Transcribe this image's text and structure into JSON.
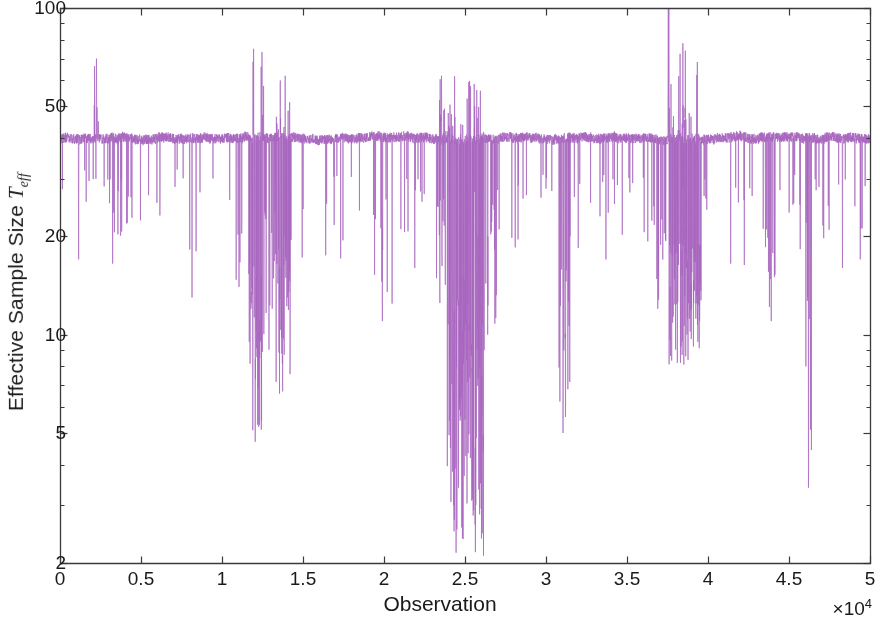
{
  "chart_data": {
    "type": "line",
    "title": "",
    "xlabel": "Observation",
    "ylabel": "Effective Sample Size T_eff",
    "ylabel_text": "Effective Sample Size ",
    "ylabel_symbol": "T",
    "ylabel_subscript": "eff",
    "xmultiplier_prefix": "×10",
    "xmultiplier_exponent": "4",
    "yscale": "log",
    "xscale": "linear",
    "grid": false,
    "legend": null,
    "xlim": [
      0,
      50000
    ],
    "ylim": [
      2,
      100
    ],
    "xticks": [
      0,
      5000,
      10000,
      15000,
      20000,
      25000,
      30000,
      35000,
      40000,
      45000,
      50000
    ],
    "xtick_labels": [
      "0",
      "0.5",
      "1",
      "1.5",
      "2",
      "2.5",
      "3",
      "3.5",
      "4",
      "4.5",
      "5"
    ],
    "yticks": [
      2,
      5,
      10,
      20,
      50,
      100
    ],
    "ytick_labels": [
      "2",
      "5",
      "10",
      "20",
      "50",
      "100"
    ],
    "series": [
      {
        "name": "Effective Sample Size",
        "color": "#a866bf",
        "linewidth": 0.7,
        "baseline": 40,
        "baseline_noise": 0.07,
        "description": "Per-observation effective sample size T_eff for a particle filter; hovers near 40 with frequent sharp downward spikes and several dense low-ESS episodes.",
        "n_points": 50000,
        "regions": [
          {
            "x_start": 0,
            "x_end": 1400,
            "kind": "calm",
            "dip_rate": 0.012,
            "dip_min": 17,
            "dip_typ": 30
          },
          {
            "x_start": 1400,
            "x_end": 2100,
            "kind": "calm",
            "dip_rate": 0.02,
            "dip_min": 22,
            "dip_typ": 32
          },
          {
            "x_start": 2100,
            "x_end": 2400,
            "kind": "peak",
            "peak_max": 70,
            "dip_rate": 0.02,
            "dip_min": 24,
            "dip_typ": 32
          },
          {
            "x_start": 2400,
            "x_end": 4500,
            "kind": "moderate",
            "dip_rate": 0.035,
            "dip_min": 16,
            "dip_typ": 30
          },
          {
            "x_start": 4500,
            "x_end": 8000,
            "kind": "calm",
            "dip_rate": 0.02,
            "dip_min": 22,
            "dip_typ": 33
          },
          {
            "x_start": 8000,
            "x_end": 8600,
            "kind": "moderate",
            "dip_rate": 0.05,
            "dip_min": 13,
            "dip_typ": 28
          },
          {
            "x_start": 8600,
            "x_end": 10800,
            "kind": "calm",
            "dip_rate": 0.018,
            "dip_min": 25,
            "dip_typ": 34
          },
          {
            "x_start": 10800,
            "x_end": 11600,
            "kind": "moderate",
            "dip_rate": 0.06,
            "dip_min": 14,
            "dip_typ": 27
          },
          {
            "x_start": 11600,
            "x_end": 12600,
            "kind": "turbulent",
            "peak_max": 75,
            "dip_rate": 0.45,
            "dip_min": 4.6,
            "dip_typ": 17
          },
          {
            "x_start": 12600,
            "x_end": 13300,
            "kind": "moderate",
            "dip_rate": 0.18,
            "dip_min": 9,
            "dip_typ": 24
          },
          {
            "x_start": 13300,
            "x_end": 14300,
            "kind": "turbulent",
            "peak_max": 62,
            "dip_rate": 0.4,
            "dip_min": 6.5,
            "dip_typ": 20
          },
          {
            "x_start": 14300,
            "x_end": 19300,
            "kind": "calm",
            "dip_rate": 0.025,
            "dip_min": 17,
            "dip_typ": 31
          },
          {
            "x_start": 19300,
            "x_end": 20600,
            "kind": "moderate",
            "dip_rate": 0.08,
            "dip_min": 11,
            "dip_typ": 26
          },
          {
            "x_start": 20600,
            "x_end": 23200,
            "kind": "calm",
            "dip_rate": 0.03,
            "dip_min": 16,
            "dip_typ": 30
          },
          {
            "x_start": 23200,
            "x_end": 23900,
            "kind": "peak",
            "peak_max": 62,
            "dip_rate": 0.12,
            "dip_min": 12,
            "dip_typ": 26
          },
          {
            "x_start": 23900,
            "x_end": 26200,
            "kind": "turbulent",
            "peak_max": 68,
            "dip_rate": 0.55,
            "dip_min": 2.1,
            "dip_typ": 13
          },
          {
            "x_start": 26200,
            "x_end": 27000,
            "kind": "moderate",
            "dip_rate": 0.12,
            "dip_min": 10,
            "dip_typ": 25
          },
          {
            "x_start": 27000,
            "x_end": 30800,
            "kind": "calm",
            "dip_rate": 0.025,
            "dip_min": 18,
            "dip_typ": 31
          },
          {
            "x_start": 30800,
            "x_end": 31500,
            "kind": "moderate",
            "dip_rate": 0.3,
            "dip_min": 5.0,
            "dip_typ": 20
          },
          {
            "x_start": 31500,
            "x_end": 36600,
            "kind": "calm",
            "dip_rate": 0.028,
            "dip_min": 17,
            "dip_typ": 31
          },
          {
            "x_start": 36600,
            "x_end": 37500,
            "kind": "moderate",
            "dip_rate": 0.1,
            "dip_min": 12,
            "dip_typ": 26
          },
          {
            "x_start": 37500,
            "x_end": 37600,
            "kind": "spike",
            "peak_max": 140,
            "dip_rate": 0.05,
            "dip_min": 20,
            "dip_typ": 32
          },
          {
            "x_start": 37600,
            "x_end": 39600,
            "kind": "turbulent",
            "peak_max": 78,
            "dip_rate": 0.5,
            "dip_min": 8,
            "dip_typ": 19
          },
          {
            "x_start": 39600,
            "x_end": 43500,
            "kind": "calm",
            "dip_rate": 0.03,
            "dip_min": 15,
            "dip_typ": 30
          },
          {
            "x_start": 43500,
            "x_end": 44300,
            "kind": "moderate",
            "dip_rate": 0.09,
            "dip_min": 11,
            "dip_typ": 26
          },
          {
            "x_start": 44300,
            "x_end": 46000,
            "kind": "calm",
            "dip_rate": 0.03,
            "dip_min": 18,
            "dip_typ": 31
          },
          {
            "x_start": 46000,
            "x_end": 46400,
            "kind": "moderate",
            "dip_rate": 0.2,
            "dip_min": 3.4,
            "dip_typ": 22
          },
          {
            "x_start": 46400,
            "x_end": 50000,
            "kind": "calm",
            "dip_rate": 0.03,
            "dip_min": 16,
            "dip_typ": 30
          }
        ],
        "deep_spikes": [
          {
            "x": 1150,
            "y": 17.0
          },
          {
            "x": 3250,
            "y": 16.5
          },
          {
            "x": 4150,
            "y": 22.0
          },
          {
            "x": 8150,
            "y": 13.0
          },
          {
            "x": 8400,
            "y": 18.0
          },
          {
            "x": 11050,
            "y": 14.0
          },
          {
            "x": 11900,
            "y": 5.1
          },
          {
            "x": 12050,
            "y": 4.7
          },
          {
            "x": 12200,
            "y": 5.3
          },
          {
            "x": 12400,
            "y": 9.5
          },
          {
            "x": 12900,
            "y": 9.0
          },
          {
            "x": 13100,
            "y": 12.0
          },
          {
            "x": 13550,
            "y": 6.6
          },
          {
            "x": 13750,
            "y": 8.0
          },
          {
            "x": 14050,
            "y": 13.0
          },
          {
            "x": 16400,
            "y": 17.5
          },
          {
            "x": 19900,
            "y": 11.0
          },
          {
            "x": 20200,
            "y": 13.5
          },
          {
            "x": 21900,
            "y": 16.0
          },
          {
            "x": 23450,
            "y": 12.5
          },
          {
            "x": 24100,
            "y": 4.5
          },
          {
            "x": 24300,
            "y": 3.0
          },
          {
            "x": 24450,
            "y": 2.15
          },
          {
            "x": 24600,
            "y": 3.4
          },
          {
            "x": 24800,
            "y": 4.0
          },
          {
            "x": 25000,
            "y": 5.5
          },
          {
            "x": 25200,
            "y": 6.5
          },
          {
            "x": 25500,
            "y": 8.5
          },
          {
            "x": 25800,
            "y": 10.5
          },
          {
            "x": 26400,
            "y": 10.0
          },
          {
            "x": 28100,
            "y": 18.5
          },
          {
            "x": 31050,
            "y": 5.0
          },
          {
            "x": 31200,
            "y": 5.6
          },
          {
            "x": 31350,
            "y": 13.0
          },
          {
            "x": 33700,
            "y": 17.0
          },
          {
            "x": 36900,
            "y": 12.0
          },
          {
            "x": 38000,
            "y": 9.0
          },
          {
            "x": 38300,
            "y": 8.2
          },
          {
            "x": 38700,
            "y": 10.0
          },
          {
            "x": 39100,
            "y": 11.5
          },
          {
            "x": 41400,
            "y": 16.5
          },
          {
            "x": 43900,
            "y": 11.0
          },
          {
            "x": 44100,
            "y": 15.0
          },
          {
            "x": 46200,
            "y": 3.4
          },
          {
            "x": 48300,
            "y": 16.0
          },
          {
            "x": 49400,
            "y": 17.0
          }
        ],
        "high_peaks": [
          {
            "x": 2250,
            "y": 70.0
          },
          {
            "x": 11950,
            "y": 75.0
          },
          {
            "x": 13600,
            "y": 60.0
          },
          {
            "x": 13900,
            "y": 62.0
          },
          {
            "x": 23550,
            "y": 62.0
          },
          {
            "x": 25600,
            "y": 50.0
          },
          {
            "x": 37550,
            "y": 140.0
          },
          {
            "x": 38450,
            "y": 78.0
          },
          {
            "x": 38600,
            "y": 74.0
          }
        ]
      }
    ]
  },
  "axes": {
    "box_color": "#3a3a3a",
    "background": "#ffffff",
    "tick_color": "#3a3a3a"
  }
}
